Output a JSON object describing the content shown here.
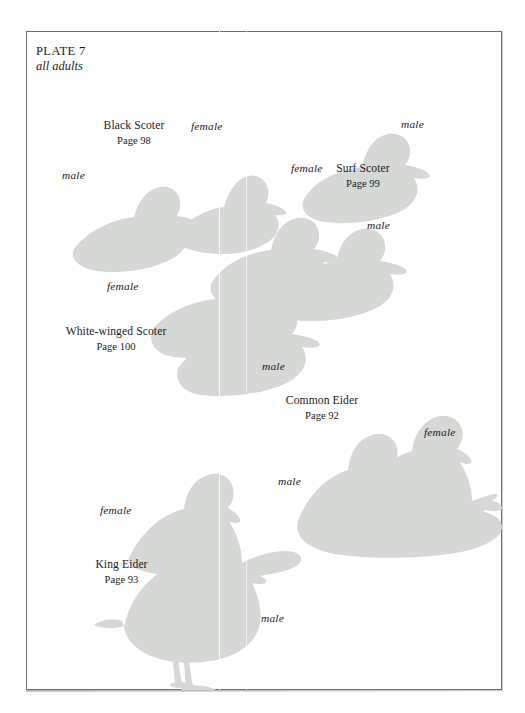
{
  "plate": {
    "title": "PLATE 7",
    "subtitle": "all adults",
    "silhouette_color": "#d5d8d4",
    "border_color": "#6e6e6e",
    "background_color": "#ffffff",
    "text_color": "#1c1c1c"
  },
  "species": [
    {
      "id": "black-scoter",
      "name": "Black Scoter",
      "page": "Page 98",
      "labels": {
        "female": "female",
        "male": "male"
      }
    },
    {
      "id": "surf-scoter",
      "name": "Surf Scoter",
      "page": "Page 99",
      "labels": {
        "female": "female",
        "male": "male"
      }
    },
    {
      "id": "white-winged-scoter",
      "name": "White-winged Scoter",
      "page": "Page 100",
      "labels": {
        "female": "female",
        "male": "male"
      }
    },
    {
      "id": "common-eider",
      "name": "Common Eider",
      "page": "Page 92",
      "labels": {
        "female": "female",
        "male": "male"
      }
    },
    {
      "id": "king-eider",
      "name": "King Eider",
      "page": "Page 93",
      "labels": {
        "female": "female",
        "male": "male"
      }
    }
  ]
}
